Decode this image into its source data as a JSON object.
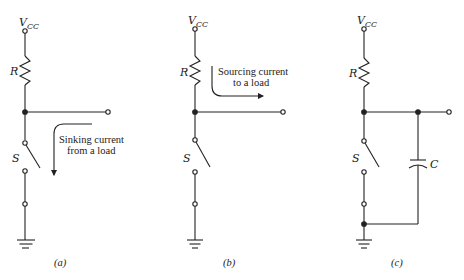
{
  "figure": {
    "circuits": [
      {
        "id": "a",
        "caption": "(a)",
        "supply_label": "V",
        "supply_sub": "CC",
        "resistor_label": "R",
        "switch_label": "S",
        "annotation": [
          "Sinking current",
          "from a load"
        ],
        "arrow_direction": "down"
      },
      {
        "id": "b",
        "caption": "(b)",
        "supply_label": "V",
        "supply_sub": "CC",
        "resistor_label": "R",
        "switch_label": "S",
        "annotation": [
          "Sourcing current",
          "to a load"
        ],
        "arrow_direction": "right"
      },
      {
        "id": "c",
        "caption": "(c)",
        "supply_label": "V",
        "supply_sub": "CC",
        "resistor_label": "R",
        "switch_label": "S",
        "capacitor_label": "C"
      }
    ],
    "colors": {
      "ink": "#222222",
      "background": "#ffffff"
    }
  }
}
